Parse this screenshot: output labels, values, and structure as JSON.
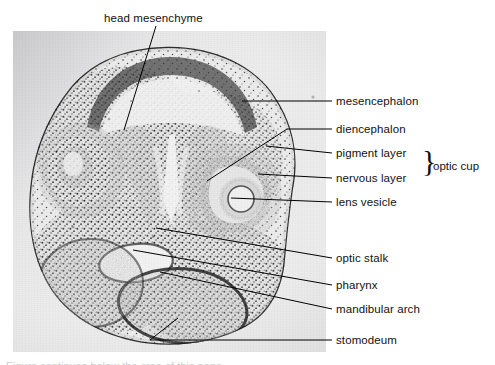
{
  "figure": {
    "type": "labeled-histology-micrograph",
    "background_color": "#ffffff",
    "plate_color": "#ececed",
    "line_color": "#000000",
    "text_color": "#111111"
  },
  "top_label": {
    "text": "head mesenchyme"
  },
  "labels": [
    {
      "id": "mesencephalon",
      "text": "mesencephalon"
    },
    {
      "id": "diencephalon",
      "text": "diencephalon"
    },
    {
      "id": "pigment-layer",
      "text": "pigment layer"
    },
    {
      "id": "nervous-layer",
      "text": "nervous layer"
    },
    {
      "id": "lens-vesicle",
      "text": "lens vesicle"
    },
    {
      "id": "optic-stalk",
      "text": "optic stalk"
    },
    {
      "id": "pharynx",
      "text": "pharynx"
    },
    {
      "id": "mandibular-arch",
      "text": "mandibular arch"
    },
    {
      "id": "stomodeum",
      "text": "stomodeum"
    }
  ],
  "bracket": {
    "glyph": "}",
    "text": "optic cup",
    "groups": [
      "pigment layer",
      "nervous layer"
    ]
  },
  "caption_strip": {
    "text": "Figure continues below the crop of this page."
  }
}
